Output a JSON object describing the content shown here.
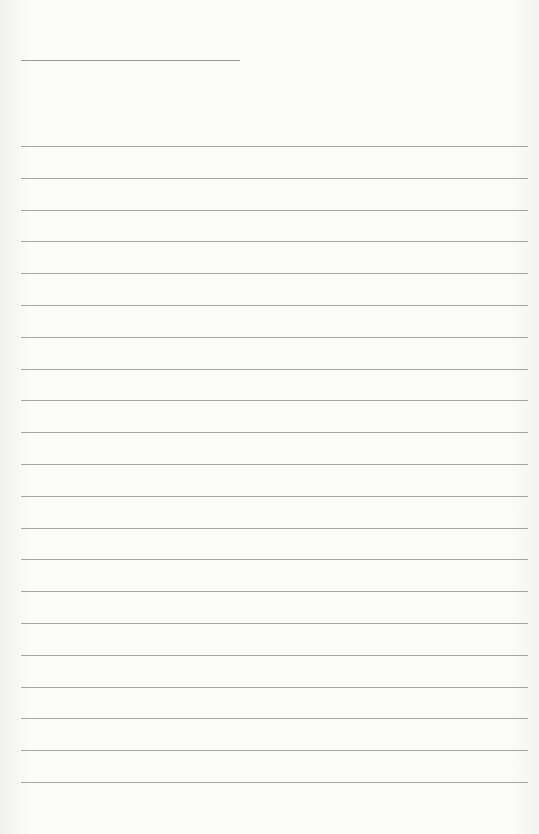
{
  "document": {
    "type": "lined-paper",
    "header_line": {
      "x": 21,
      "y": 60,
      "width": 219
    },
    "ruled_lines": {
      "count": 21,
      "start_y": 146,
      "spacing": 31.8,
      "x": 21,
      "width": 507
    },
    "colors": {
      "paper": "#fbfbfa",
      "line": "#a3a3a3"
    }
  }
}
